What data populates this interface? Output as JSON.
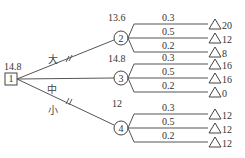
{
  "root": {
    "id": "1",
    "value": "14.8",
    "shape": "square"
  },
  "branches": [
    {
      "label": "大",
      "pruned": true,
      "node": {
        "id": "2",
        "value": "13.6",
        "outcomes": [
          {
            "prob": "0.3",
            "payoff": "20"
          },
          {
            "prob": "0.5",
            "payoff": "12"
          },
          {
            "prob": "0.2",
            "payoff": "8"
          }
        ]
      }
    },
    {
      "label": "中",
      "pruned": false,
      "node": {
        "id": "3",
        "value": "14.8",
        "outcomes": [
          {
            "prob": "0.3",
            "payoff": "16"
          },
          {
            "prob": "0.5",
            "payoff": "16"
          },
          {
            "prob": "0.2",
            "payoff": "0"
          }
        ]
      }
    },
    {
      "label": "小",
      "pruned": true,
      "node": {
        "id": "4",
        "value": "12",
        "outcomes": [
          {
            "prob": "0.3",
            "payoff": "12"
          },
          {
            "prob": "0.5",
            "payoff": "12"
          },
          {
            "prob": "0.2",
            "payoff": "12"
          }
        ]
      }
    }
  ],
  "symbols": {
    "prune_mark": "//",
    "terminal": "triangle-icon",
    "chance": "circle",
    "decision": "square"
  }
}
